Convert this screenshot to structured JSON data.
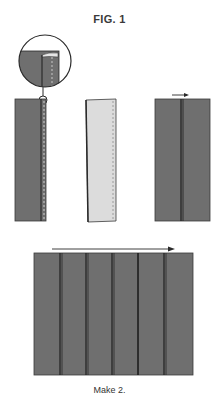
{
  "figure": {
    "title": "FIG. 1",
    "caption": "Make 2.",
    "colors": {
      "fabric_dark": "#6f6f6f",
      "fabric_light": "#dcdcdc",
      "seam_line": "#1e1e1e",
      "outline": "#3a3a3a",
      "background": "#ffffff"
    },
    "steps": [
      {
        "id": "step-1",
        "description": "Single dark strip with stitch line along right edge and magnified detail circle"
      },
      {
        "id": "step-2",
        "description": "Strip flipped showing light wrong side with dashed stitch line"
      },
      {
        "id": "step-3",
        "description": "Two strips sewn and pressed open, arrow pointing right"
      },
      {
        "id": "step-4",
        "description": "Six strips sewn together, long arrow pointing right"
      }
    ],
    "strip_count_final": 6
  }
}
